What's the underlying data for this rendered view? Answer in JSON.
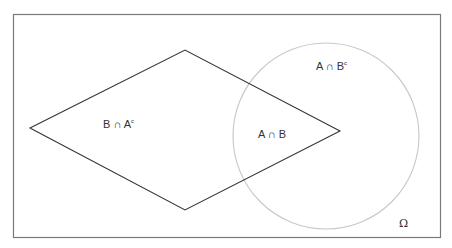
{
  "diagram": {
    "type": "venn",
    "universe": {
      "label": "Ω",
      "border_color": "#7a7a7a"
    },
    "set_B_shape": {
      "shape": "diamond",
      "stroke": "#333333"
    },
    "set_A_shape": {
      "shape": "circle",
      "stroke": "#c8c8c8"
    },
    "regions": {
      "b_only": {
        "text": "B ∩ A",
        "sup": "c"
      },
      "intersection": {
        "text": "A ∩ B"
      },
      "a_only": {
        "text": "A ∩ B",
        "sup": "c"
      }
    }
  }
}
